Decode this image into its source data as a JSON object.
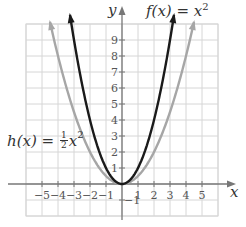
{
  "chart_data": {
    "type": "line",
    "title": "",
    "xlabel": "x",
    "ylabel": "y",
    "xlim": [
      -6,
      6
    ],
    "ylim": [
      -1,
      10
    ],
    "grid": true,
    "x_ticks": [
      "-5",
      "-4",
      "-3",
      "-2",
      "-1",
      "1",
      "2",
      "3",
      "4",
      "5"
    ],
    "y_ticks": [
      "-1",
      "1",
      "2",
      "3",
      "4",
      "5",
      "6",
      "7",
      "8",
      "9"
    ],
    "series": [
      {
        "name": "f(x) = x^2",
        "color": "#1a1a1a",
        "x": [
          -3.2,
          -3,
          -2,
          -1,
          0,
          1,
          2,
          3,
          3.2
        ],
        "y": [
          10.24,
          9,
          4,
          1,
          0,
          1,
          4,
          9,
          10.24
        ]
      },
      {
        "name": "h(x) = 1/2 x^2",
        "color": "#a6a6a6",
        "x": [
          -4.5,
          -4,
          -3,
          -2,
          -1,
          0,
          1,
          2,
          3,
          4,
          4.5
        ],
        "y": [
          10.1,
          8,
          4.5,
          2,
          0.5,
          0,
          0.5,
          2,
          4.5,
          8,
          10.1
        ]
      }
    ],
    "annotations": [
      {
        "text": "f(x) = x²",
        "position": "top-right"
      },
      {
        "text": "h(x) = ½x²",
        "position": "left"
      }
    ]
  },
  "labels": {
    "f_label": "f(x) = x",
    "f_exp": "2",
    "h_label_prefix": "h(x) = ",
    "h_num": "1",
    "h_den": "2",
    "h_suffix": "x",
    "h_exp": "2",
    "x_axis": "x",
    "y_axis": "y"
  }
}
